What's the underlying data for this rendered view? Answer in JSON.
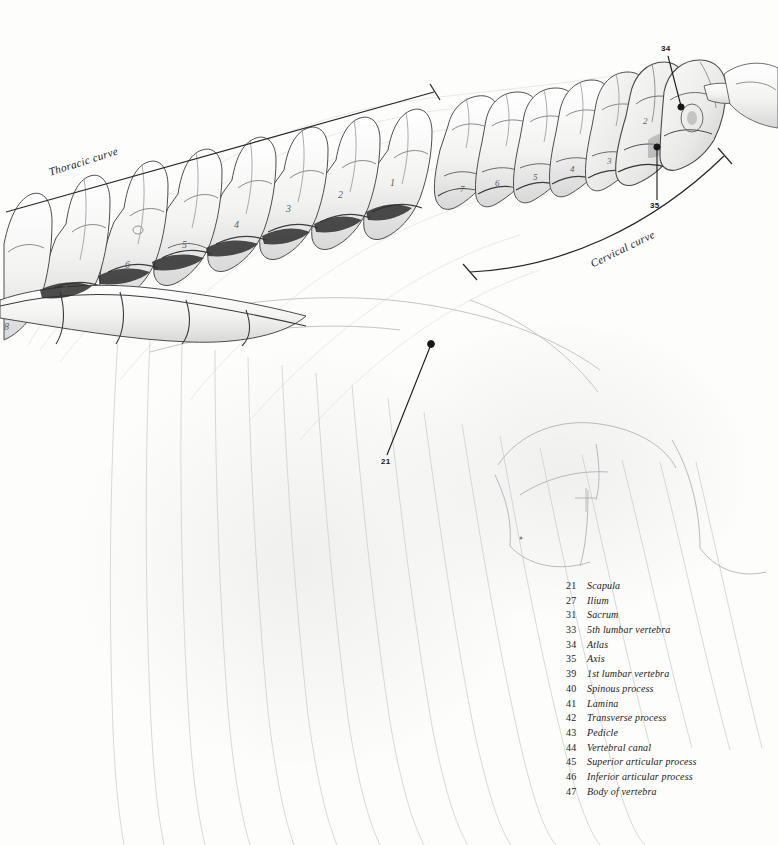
{
  "plate": {
    "background_color": "#fdfdfc",
    "ink_color": "#1b1b1a",
    "pencil_color": "#8d8d90"
  },
  "curve_labels": [
    {
      "id": "thoracic",
      "text": "Thoracic curve"
    },
    {
      "id": "cervical",
      "text": "Cervical curve"
    }
  ],
  "callouts": [
    {
      "id": "34",
      "number": "34",
      "refers_to": "Atlas"
    },
    {
      "id": "35",
      "number": "35",
      "refers_to": "Axis"
    },
    {
      "id": "21",
      "number": "21",
      "refers_to": "Scapula"
    }
  ],
  "vertebra_numerals": {
    "cervical": [
      "7",
      "6",
      "5",
      "4",
      "3",
      "2"
    ],
    "thoracic": [
      "7",
      "6",
      "5",
      "4",
      "3",
      "2",
      "1"
    ]
  },
  "legend": {
    "entries": [
      {
        "number": "21",
        "term": "Scapula"
      },
      {
        "number": "27",
        "term": "Ilium"
      },
      {
        "number": "31",
        "term": "Sacrum"
      },
      {
        "number": "33",
        "term": "5th lumbar vertebra"
      },
      {
        "number": "34",
        "term": "Atlas"
      },
      {
        "number": "35",
        "term": "Axis"
      },
      {
        "number": "39",
        "term": "1st lumbar vertebra"
      },
      {
        "number": "40",
        "term": "Spinous process"
      },
      {
        "number": "41",
        "term": "Lamina"
      },
      {
        "number": "42",
        "term": "Transverse process"
      },
      {
        "number": "43",
        "term": "Pedicle"
      },
      {
        "number": "44",
        "term": "Vertebral canal"
      },
      {
        "number": "45",
        "term": "Superior articular process"
      },
      {
        "number": "46",
        "term": "Inferior articular process"
      },
      {
        "number": "47",
        "term": "Body of vertebra"
      }
    ]
  }
}
